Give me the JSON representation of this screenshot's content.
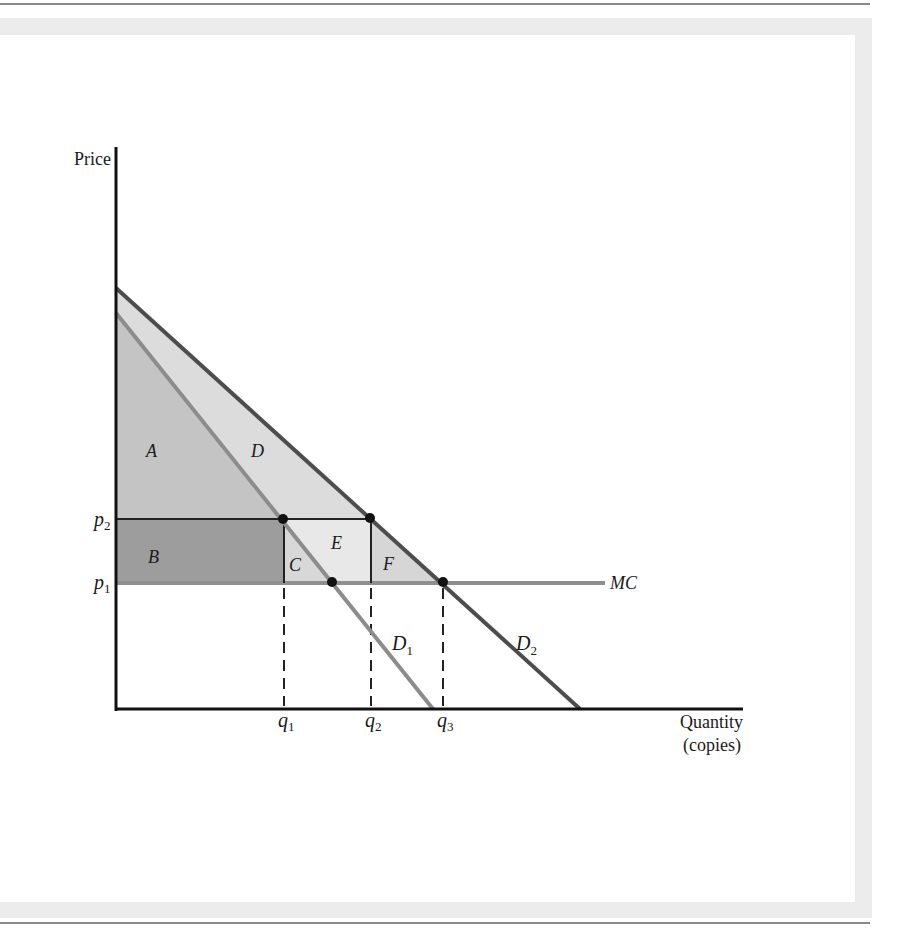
{
  "diagram": {
    "type": "economics-demand-diagram",
    "axes": {
      "y_label": "Price",
      "x_label_line1": "Quantity",
      "x_label_line2": "(copies)"
    },
    "price_ticks": [
      {
        "base": "p",
        "sub": "2"
      },
      {
        "base": "p",
        "sub": "1"
      }
    ],
    "quantity_ticks": [
      {
        "base": "q",
        "sub": "1"
      },
      {
        "base": "q",
        "sub": "2"
      },
      {
        "base": "q",
        "sub": "3"
      }
    ],
    "curves": {
      "d1": {
        "base": "D",
        "sub": "1"
      },
      "d2": {
        "base": "D",
        "sub": "2"
      },
      "mc": "MC"
    },
    "regions": {
      "a": "A",
      "b": "B",
      "c": "C",
      "d": "D",
      "e": "E",
      "f": "F"
    },
    "colors": {
      "axis": "#111111",
      "d1_line": "#8c8c8c",
      "d2_line": "#4d4d4d",
      "mc_line": "#8f8f8f",
      "region_a": "#c4c4c4",
      "region_b": "#9d9d9d",
      "region_c": "#d8d8d8",
      "region_d": "#dcdcdc",
      "region_e": "#e8e8e8",
      "region_f": "#d6d6d6",
      "frame": "#ececec"
    }
  }
}
